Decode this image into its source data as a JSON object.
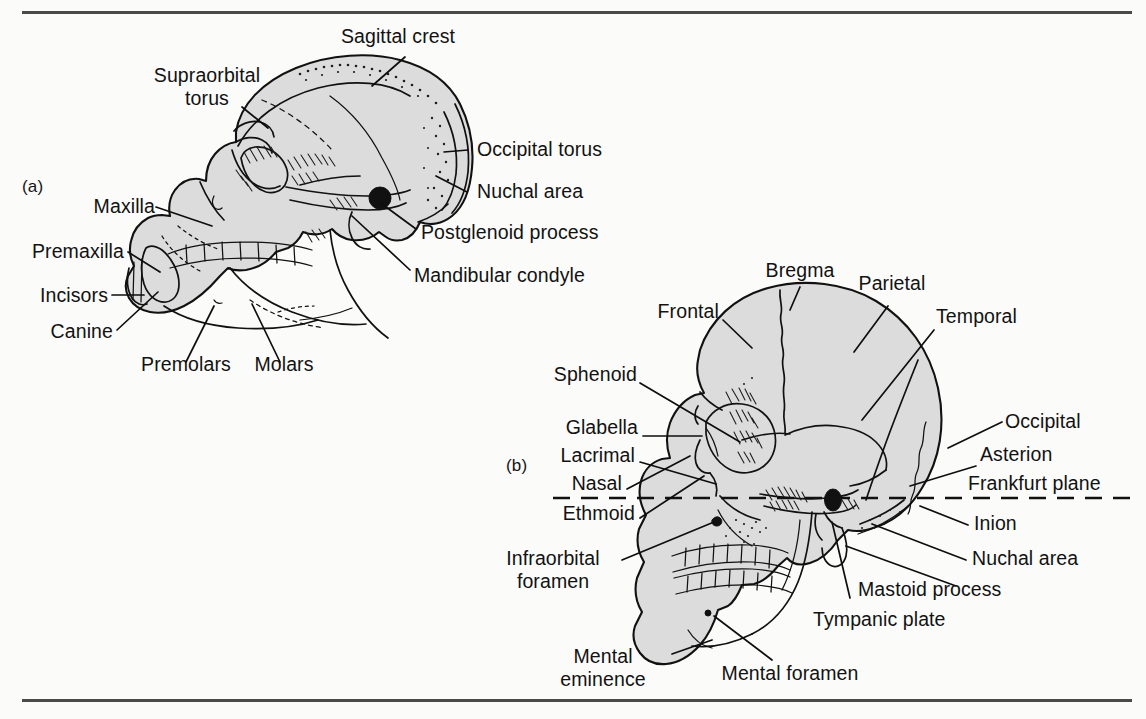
{
  "figure": {
    "kind": "anatomical-line-drawing",
    "background_color": "#fbfbf9",
    "bone_fill_color": "#dcdcdc",
    "ink_color": "#111111",
    "rules": {
      "top": "horizontal rule",
      "bottom": "horizontal rule"
    }
  },
  "panel_a": {
    "tag": "(a)",
    "subject": "ape (gorilla) skull, lateral view",
    "labels": [
      {
        "id": "sagittal-crest",
        "text": "Sagittal crest"
      },
      {
        "id": "supraorbital-torus",
        "text": "Supraorbital\ntorus"
      },
      {
        "id": "occipital-torus",
        "text": "Occipital torus"
      },
      {
        "id": "nuchal-area",
        "text": "Nuchal area"
      },
      {
        "id": "maxilla",
        "text": "Maxilla"
      },
      {
        "id": "postglenoid-process",
        "text": "Postglenoid process"
      },
      {
        "id": "premaxilla",
        "text": "Premaxilla"
      },
      {
        "id": "mandibular-condyle",
        "text": "Mandibular condyle"
      },
      {
        "id": "incisors",
        "text": "Incisors"
      },
      {
        "id": "canine",
        "text": "Canine"
      },
      {
        "id": "premolars",
        "text": "Premolars"
      },
      {
        "id": "molars",
        "text": "Molars"
      }
    ]
  },
  "panel_b": {
    "tag": "(b)",
    "subject": "human skull, lateral view",
    "labels": [
      {
        "id": "bregma",
        "text": "Bregma"
      },
      {
        "id": "parietal",
        "text": "Parietal"
      },
      {
        "id": "frontal",
        "text": "Frontal"
      },
      {
        "id": "temporal",
        "text": "Temporal"
      },
      {
        "id": "sphenoid",
        "text": "Sphenoid"
      },
      {
        "id": "glabella",
        "text": "Glabella"
      },
      {
        "id": "occipital",
        "text": "Occipital"
      },
      {
        "id": "lacrimal",
        "text": "Lacrimal"
      },
      {
        "id": "asterion",
        "text": "Asterion"
      },
      {
        "id": "nasal",
        "text": "Nasal"
      },
      {
        "id": "frankfurt-plane",
        "text": "Frankfurt plane"
      },
      {
        "id": "ethmoid",
        "text": "Ethmoid"
      },
      {
        "id": "inion",
        "text": "Inion"
      },
      {
        "id": "infraorbital-foramen",
        "text": "Infraorbital\nforamen"
      },
      {
        "id": "nuchal-area",
        "text": "Nuchal area"
      },
      {
        "id": "mastoid-process",
        "text": "Mastoid process"
      },
      {
        "id": "tympanic-plate",
        "text": "Tympanic plate"
      },
      {
        "id": "mental-eminence",
        "text": "Mental\neminence"
      },
      {
        "id": "mental-foramen",
        "text": "Mental foramen"
      }
    ],
    "reference_line": {
      "id": "frankfurt-plane-line",
      "style": "dashed horizontal",
      "label": "Frankfurt plane"
    }
  }
}
